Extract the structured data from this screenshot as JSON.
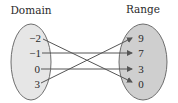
{
  "diagram": {
    "type": "function-mapping",
    "domain_label": "Domain",
    "range_label": "Range",
    "domain": [
      "−2",
      "−1",
      "0",
      "3"
    ],
    "range": [
      "9",
      "7",
      "3",
      "0"
    ],
    "mapping": [
      {
        "from": "−2",
        "to": "0"
      },
      {
        "from": "−1",
        "to": "7"
      },
      {
        "from": "0",
        "to": "3"
      },
      {
        "from": "3",
        "to": "9"
      }
    ],
    "colors": {
      "domain_fill": "#e6e6e6",
      "range_fill": "#cfcfcf",
      "stroke": "#6e6e6e",
      "arrow": "#555555",
      "text": "#2a2a2a"
    }
  }
}
